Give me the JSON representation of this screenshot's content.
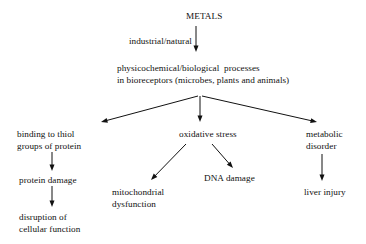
{
  "diagram": {
    "title_node": {
      "id": "metals",
      "label": "METALS",
      "x": 186,
      "y": 10
    },
    "edge_labels": [
      {
        "id": "industrial-natural",
        "label": "industrial/natural",
        "x": 129,
        "y": 35
      }
    ],
    "nodes": [
      {
        "id": "physicochemical-processes",
        "lines": [
          "physicochemical/biological  processes",
          "in bioreceptors (microbes, plants and animals)"
        ],
        "x": 117,
        "y": 62,
        "align": "left"
      },
      {
        "id": "binding-to-thiol-groups",
        "lines": [
          "binding to thiol",
          "groups of protein"
        ],
        "x": 17,
        "y": 128,
        "align": "left"
      },
      {
        "id": "oxidative-stress",
        "lines": [
          "oxidative stress"
        ],
        "x": 179,
        "y": 128,
        "align": "left"
      },
      {
        "id": "metabolic-disorder",
        "lines": [
          "metabolic",
          "disorder"
        ],
        "x": 306,
        "y": 128,
        "align": "left"
      },
      {
        "id": "protein-damage",
        "lines": [
          "protein damage"
        ],
        "x": 19,
        "y": 174,
        "align": "left"
      },
      {
        "id": "mitochondrial-dysfunction",
        "lines": [
          "mitochondrial",
          "dysfunction"
        ],
        "x": 112,
        "y": 186,
        "align": "left"
      },
      {
        "id": "dna-damage",
        "lines": [
          "DNA damage"
        ],
        "x": 204,
        "y": 172,
        "align": "left"
      },
      {
        "id": "liver-injury",
        "lines": [
          "liver injury"
        ],
        "x": 304,
        "y": 186,
        "align": "left"
      },
      {
        "id": "disruption-of-cellular-function",
        "lines": [
          "disruption of",
          "cellular function"
        ],
        "x": 19,
        "y": 211,
        "align": "left"
      }
    ],
    "arrows": [
      {
        "id": "metals-to-processes",
        "x1": 196,
        "y1": 26,
        "x2": 196,
        "y2": 52
      },
      {
        "id": "processes-to-binding",
        "x1": 198,
        "y1": 96,
        "x2": 101,
        "y2": 122
      },
      {
        "id": "processes-to-oxidative",
        "x1": 200,
        "y1": 96,
        "x2": 200,
        "y2": 122
      },
      {
        "id": "processes-to-metabolic",
        "x1": 202,
        "y1": 96,
        "x2": 317,
        "y2": 122
      },
      {
        "id": "binding-to-protein-damage",
        "x1": 52,
        "y1": 152,
        "x2": 52,
        "y2": 171
      },
      {
        "id": "protein-damage-to-disruption",
        "x1": 52,
        "y1": 186,
        "x2": 52,
        "y2": 207
      },
      {
        "id": "oxidative-to-mitochondrial",
        "x1": 186,
        "y1": 144,
        "x2": 151,
        "y2": 180
      },
      {
        "id": "oxidative-to-dna",
        "x1": 212,
        "y1": 144,
        "x2": 233,
        "y2": 168
      },
      {
        "id": "metabolic-to-liver",
        "x1": 322,
        "y1": 154,
        "x2": 322,
        "y2": 181
      }
    ],
    "colors": {
      "stroke": "#111111",
      "text": "#111111",
      "background": "#ffffff"
    }
  }
}
